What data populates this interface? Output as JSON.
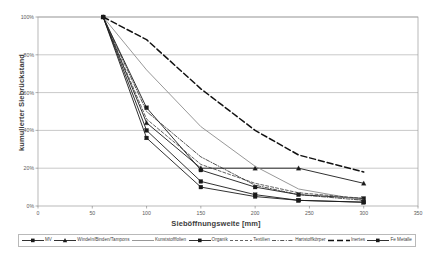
{
  "chart_data": {
    "type": "line",
    "title": "",
    "xlabel": "Sieböffnungsweite [mm]",
    "ylabel": "kumulierter Siebrückstand",
    "xlim": [
      0,
      350
    ],
    "ylim": [
      0,
      100
    ],
    "xticks": [
      "0",
      "50",
      "100",
      "150",
      "200",
      "250",
      "300",
      "350"
    ],
    "xtick_values": [
      0,
      50,
      100,
      150,
      200,
      250,
      300,
      350
    ],
    "yticks": [
      "0%",
      "20%",
      "40%",
      "60%",
      "80%",
      "100%"
    ],
    "ytick_values": [
      0,
      20,
      40,
      60,
      80,
      100
    ],
    "grid": "horizontal",
    "legend_position": "bottom",
    "series": [
      {
        "name": "MV",
        "marker": "square",
        "dash": "solid",
        "color": "#1a1a1a",
        "width": 0.9,
        "points": [
          [
            60,
            100
          ],
          [
            100,
            52
          ],
          [
            150,
            19
          ],
          [
            200,
            10
          ],
          [
            240,
            6
          ],
          [
            300,
            4
          ]
        ]
      },
      {
        "name": "Windeln/Binden/Tampons",
        "marker": "triangle",
        "dash": "solid",
        "color": "#1a1a1a",
        "width": 0.9,
        "points": [
          [
            60,
            100
          ],
          [
            100,
            44
          ],
          [
            150,
            20
          ],
          [
            200,
            20
          ],
          [
            240,
            20
          ],
          [
            300,
            12
          ]
        ]
      },
      {
        "name": "Kunststofffolien",
        "marker": "none",
        "dash": "solid",
        "color": "#8c8c8c",
        "width": 0.9,
        "points": [
          [
            60,
            100
          ],
          [
            100,
            72
          ],
          [
            150,
            42
          ],
          [
            200,
            21
          ],
          [
            240,
            9
          ],
          [
            300,
            3
          ]
        ]
      },
      {
        "name": "Organik",
        "marker": "square",
        "dash": "solid",
        "color": "#1a1a1a",
        "width": 0.9,
        "points": [
          [
            60,
            100
          ],
          [
            100,
            40
          ],
          [
            150,
            13
          ],
          [
            200,
            6
          ],
          [
            240,
            3
          ],
          [
            300,
            2
          ]
        ]
      },
      {
        "name": "Textilien",
        "marker": "none",
        "dash": "dashed-fine",
        "color": "#3a3a3a",
        "width": 0.8,
        "points": [
          [
            60,
            100
          ],
          [
            100,
            46
          ],
          [
            150,
            22
          ],
          [
            200,
            12
          ],
          [
            240,
            7
          ],
          [
            300,
            4
          ]
        ]
      },
      {
        "name": "Hartstoffkörper",
        "marker": "none",
        "dash": "dashdot",
        "color": "#2a2a2a",
        "width": 0.8,
        "points": [
          [
            60,
            100
          ],
          [
            100,
            50
          ],
          [
            150,
            26
          ],
          [
            200,
            11
          ],
          [
            240,
            6
          ],
          [
            300,
            3
          ]
        ]
      },
      {
        "name": "Inertes",
        "marker": "none",
        "dash": "dashed-bold",
        "color": "#111111",
        "width": 1.5,
        "points": [
          [
            60,
            100
          ],
          [
            100,
            88
          ],
          [
            150,
            62
          ],
          [
            200,
            40
          ],
          [
            240,
            27
          ],
          [
            300,
            18
          ]
        ]
      },
      {
        "name": "Fe Metalle",
        "marker": "square",
        "dash": "solid",
        "color": "#1a1a1a",
        "width": 0.9,
        "points": [
          [
            60,
            100
          ],
          [
            100,
            36
          ],
          [
            150,
            10
          ],
          [
            200,
            5
          ],
          [
            240,
            3
          ],
          [
            300,
            2
          ]
        ]
      }
    ]
  },
  "legend": {
    "items": [
      {
        "label": "MV",
        "key": "line-square-marker"
      },
      {
        "label": "Windeln/Binden/Tampons",
        "key": "line-triangle-marker"
      },
      {
        "label": "Kunststofffolien",
        "key": "line-plain-gray"
      },
      {
        "label": "Organik",
        "key": "line-square-marker"
      },
      {
        "label": "Textilien",
        "key": "line-dashed-fine"
      },
      {
        "label": "Hartstoffkörper",
        "key": "line-dashdot"
      },
      {
        "label": "Inertes",
        "key": "line-plain-dark"
      },
      {
        "label": "Fe Metalle",
        "key": "line-square-marker"
      }
    ]
  }
}
